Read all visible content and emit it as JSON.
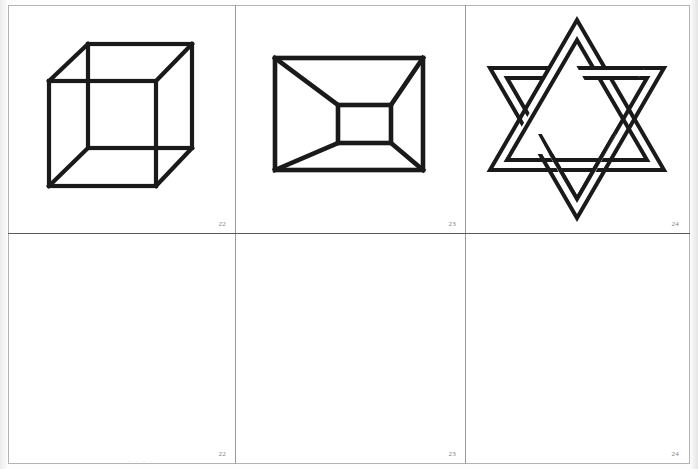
{
  "plate": {
    "title": "Ambiguous / reversible figures plate",
    "background_color": "#ffffff",
    "ink_color": "#1a1a1a",
    "rule_color": "#9a9a9a",
    "label_color": "#7c7c7c",
    "width": 698,
    "height": 469,
    "columns": 3,
    "rows": 2,
    "bottom_caption": "· · · ·"
  },
  "cells": [
    {
      "id": "cell-r1c1",
      "figure": "necker-cube",
      "figure_label": "Necker cube",
      "number": "22",
      "row": 1,
      "column": 1,
      "has_drawing": true
    },
    {
      "id": "cell-r1c2",
      "figure": "schroeder-truncated-pyramid",
      "figure_label": "Nested rectangle / truncated pyramid",
      "number": "23",
      "row": 1,
      "column": 2,
      "has_drawing": true
    },
    {
      "id": "cell-r1c3",
      "figure": "interwoven-hexagram",
      "figure_label": "Interwoven six-pointed star",
      "number": "24",
      "row": 1,
      "column": 3,
      "has_drawing": true
    },
    {
      "id": "cell-r2c1",
      "figure": "blank",
      "figure_label": "Blank response area",
      "number": "22",
      "row": 2,
      "column": 1,
      "has_drawing": false
    },
    {
      "id": "cell-r2c2",
      "figure": "blank",
      "figure_label": "Blank response area",
      "number": "23",
      "row": 2,
      "column": 2,
      "has_drawing": false
    },
    {
      "id": "cell-r2c3",
      "figure": "blank",
      "figure_label": "Blank response area",
      "number": "24",
      "row": 2,
      "column": 3,
      "has_drawing": false
    }
  ]
}
